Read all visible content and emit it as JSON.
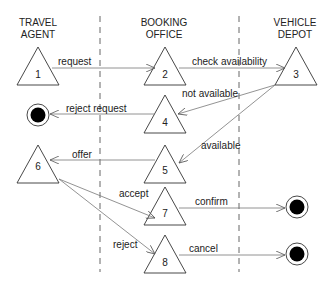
{
  "diagram": {
    "type": "swimlane-state-diagram",
    "lanes": [
      {
        "id": "travel-agent",
        "line1": "TRAVEL",
        "line2": "AGENT"
      },
      {
        "id": "booking-office",
        "line1": "BOOKING",
        "line2": "OFFICE"
      },
      {
        "id": "vehicle-depot",
        "line1": "VEHICLE",
        "line2": "DEPOT"
      }
    ],
    "states": [
      {
        "id": "1",
        "label": "1",
        "lane": "travel-agent"
      },
      {
        "id": "2",
        "label": "2",
        "lane": "booking-office"
      },
      {
        "id": "3",
        "label": "3",
        "lane": "vehicle-depot"
      },
      {
        "id": "4",
        "label": "4",
        "lane": "booking-office"
      },
      {
        "id": "5",
        "label": "5",
        "lane": "booking-office"
      },
      {
        "id": "6",
        "label": "6",
        "lane": "travel-agent"
      },
      {
        "id": "7",
        "label": "7",
        "lane": "booking-office"
      },
      {
        "id": "8",
        "label": "8",
        "lane": "booking-office"
      }
    ],
    "end_states": [
      {
        "id": "end-reject-request",
        "lane": "travel-agent"
      },
      {
        "id": "end-confirm",
        "lane": "vehicle-depot"
      },
      {
        "id": "end-cancel",
        "lane": "vehicle-depot"
      }
    ],
    "transitions": [
      {
        "from": "1",
        "to": "2",
        "label": "request"
      },
      {
        "from": "2",
        "to": "3",
        "label": "check availability"
      },
      {
        "from": "3",
        "to": "4",
        "label": "not available"
      },
      {
        "from": "4",
        "to": "end-reject-request",
        "label": "reject request"
      },
      {
        "from": "3",
        "to": "5",
        "label": "available"
      },
      {
        "from": "5",
        "to": "6",
        "label": "offer"
      },
      {
        "from": "6",
        "to": "7",
        "label": "accept"
      },
      {
        "from": "7",
        "to": "end-confirm",
        "label": "confirm"
      },
      {
        "from": "6",
        "to": "8",
        "label": "reject"
      },
      {
        "from": "8",
        "to": "end-cancel",
        "label": "cancel"
      }
    ],
    "colors": {
      "line": "#333333",
      "arrow": "#666666",
      "dashed": "#555555",
      "end_fill": "#000000"
    }
  }
}
